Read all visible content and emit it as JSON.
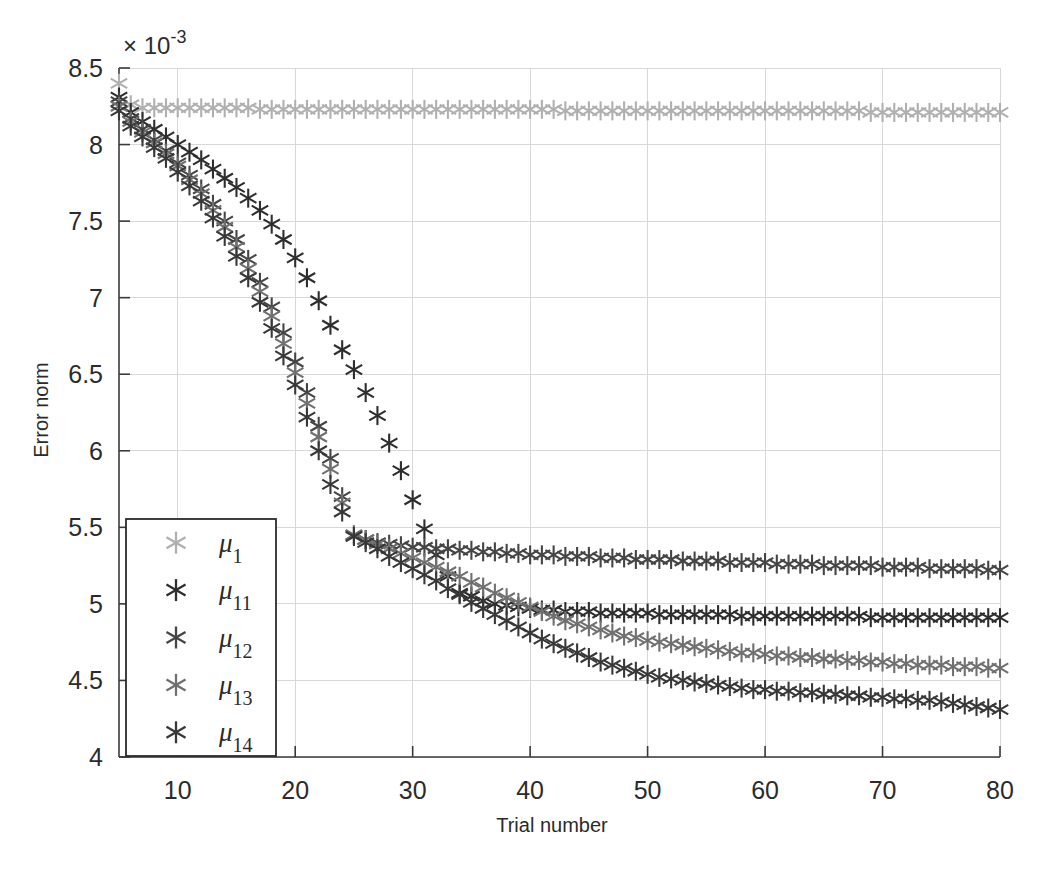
{
  "chart_data": {
    "type": "scatter",
    "title": "",
    "xlabel": "Trial number",
    "ylabel": "Error norm",
    "y_exponent_label": "× 10",
    "y_exponent_power": "-3",
    "xlim": [
      5,
      80
    ],
    "ylim": [
      4,
      8.5
    ],
    "xticks": [
      10,
      20,
      30,
      40,
      50,
      60,
      70,
      80
    ],
    "yticks": [
      4,
      4.5,
      5,
      5.5,
      6,
      6.5,
      7,
      7.5,
      8,
      8.5
    ],
    "grid": true,
    "legend_position": "lower left",
    "marker": "asterisk",
    "x": [
      5,
      6,
      7,
      8,
      9,
      10,
      11,
      12,
      13,
      14,
      15,
      16,
      17,
      18,
      19,
      20,
      21,
      22,
      23,
      24,
      25,
      26,
      27,
      28,
      29,
      30,
      31,
      32,
      33,
      34,
      35,
      36,
      37,
      38,
      39,
      40,
      41,
      42,
      43,
      44,
      45,
      46,
      47,
      48,
      49,
      50,
      51,
      52,
      53,
      54,
      55,
      56,
      57,
      58,
      59,
      60,
      61,
      62,
      63,
      64,
      65,
      66,
      67,
      68,
      69,
      70,
      71,
      72,
      73,
      74,
      75,
      76,
      77,
      78,
      79,
      80
    ],
    "series": [
      {
        "name": "μ",
        "subscript": "1",
        "color": "#b0b0b0",
        "values": [
          8.4,
          8.26,
          8.24,
          8.24,
          8.24,
          8.24,
          8.24,
          8.24,
          8.24,
          8.24,
          8.24,
          8.24,
          8.23,
          8.23,
          8.23,
          8.23,
          8.23,
          8.23,
          8.23,
          8.23,
          8.23,
          8.23,
          8.23,
          8.23,
          8.23,
          8.23,
          8.23,
          8.23,
          8.23,
          8.23,
          8.23,
          8.23,
          8.23,
          8.23,
          8.23,
          8.23,
          8.23,
          8.23,
          8.22,
          8.22,
          8.22,
          8.22,
          8.22,
          8.22,
          8.22,
          8.22,
          8.22,
          8.22,
          8.22,
          8.22,
          8.22,
          8.22,
          8.22,
          8.22,
          8.22,
          8.22,
          8.22,
          8.22,
          8.22,
          8.22,
          8.22,
          8.22,
          8.22,
          8.22,
          8.21,
          8.21,
          8.21,
          8.21,
          8.21,
          8.21,
          8.21,
          8.21,
          8.21,
          8.21,
          8.21,
          8.21
        ]
      },
      {
        "name": "μ",
        "subscript": "11",
        "color": "#2e2e2e",
        "values": [
          8.31,
          8.21,
          8.15,
          8.1,
          8.05,
          8.0,
          7.95,
          7.9,
          7.84,
          7.78,
          7.72,
          7.65,
          7.57,
          7.48,
          7.38,
          7.26,
          7.13,
          6.98,
          6.82,
          6.66,
          6.53,
          6.38,
          6.23,
          6.05,
          5.87,
          5.68,
          5.49,
          5.32,
          5.18,
          5.07,
          5.05,
          5.02,
          5.0,
          4.99,
          4.98,
          4.97,
          4.96,
          4.96,
          4.95,
          4.95,
          4.95,
          4.94,
          4.94,
          4.94,
          4.94,
          4.94,
          4.93,
          4.93,
          4.93,
          4.93,
          4.93,
          4.93,
          4.93,
          4.92,
          4.92,
          4.92,
          4.92,
          4.92,
          4.92,
          4.92,
          4.92,
          4.92,
          4.92,
          4.92,
          4.91,
          4.91,
          4.91,
          4.91,
          4.91,
          4.91,
          4.91,
          4.91,
          4.91,
          4.91,
          4.91,
          4.91
        ]
      },
      {
        "name": "μ",
        "subscript": "12",
        "color": "#454545",
        "values": [
          8.28,
          8.17,
          8.1,
          8.03,
          7.96,
          7.88,
          7.8,
          7.71,
          7.61,
          7.5,
          7.38,
          7.25,
          7.1,
          6.94,
          6.77,
          6.58,
          6.38,
          6.16,
          5.95,
          5.7,
          5.45,
          5.42,
          5.4,
          5.39,
          5.38,
          5.37,
          5.37,
          5.36,
          5.36,
          5.35,
          5.35,
          5.34,
          5.34,
          5.33,
          5.33,
          5.32,
          5.32,
          5.32,
          5.31,
          5.31,
          5.31,
          5.3,
          5.3,
          5.3,
          5.29,
          5.29,
          5.29,
          5.29,
          5.28,
          5.28,
          5.28,
          5.28,
          5.27,
          5.27,
          5.27,
          5.27,
          5.26,
          5.26,
          5.26,
          5.26,
          5.25,
          5.25,
          5.25,
          5.25,
          5.25,
          5.24,
          5.24,
          5.24,
          5.24,
          5.23,
          5.23,
          5.23,
          5.23,
          5.23,
          5.22,
          5.22
        ]
      },
      {
        "name": "μ",
        "subscript": "13",
        "color": "#707070",
        "values": [
          8.25,
          8.15,
          8.08,
          8.01,
          7.94,
          7.86,
          7.77,
          7.68,
          7.57,
          7.46,
          7.33,
          7.19,
          7.04,
          6.88,
          6.7,
          6.51,
          6.31,
          6.09,
          5.88,
          5.66,
          5.45,
          5.42,
          5.39,
          5.36,
          5.33,
          5.3,
          5.27,
          5.24,
          5.21,
          5.18,
          5.14,
          5.11,
          5.07,
          5.04,
          5.01,
          4.98,
          4.95,
          4.92,
          4.89,
          4.87,
          4.85,
          4.83,
          4.81,
          4.79,
          4.78,
          4.76,
          4.75,
          4.74,
          4.73,
          4.72,
          4.71,
          4.7,
          4.69,
          4.68,
          4.68,
          4.67,
          4.66,
          4.66,
          4.65,
          4.65,
          4.64,
          4.64,
          4.63,
          4.63,
          4.62,
          4.62,
          4.61,
          4.61,
          4.6,
          4.6,
          4.6,
          4.59,
          4.59,
          4.59,
          4.58,
          4.58
        ]
      },
      {
        "name": "μ",
        "subscript": "14",
        "color": "#383838",
        "values": [
          8.22,
          8.12,
          8.05,
          7.98,
          7.91,
          7.82,
          7.73,
          7.63,
          7.52,
          7.4,
          7.27,
          7.13,
          6.97,
          6.8,
          6.62,
          6.43,
          6.22,
          6.0,
          5.78,
          5.6,
          5.44,
          5.4,
          5.36,
          5.31,
          5.27,
          5.23,
          5.19,
          5.15,
          5.1,
          5.06,
          5.01,
          4.97,
          4.93,
          4.89,
          4.85,
          4.81,
          4.77,
          4.74,
          4.71,
          4.68,
          4.65,
          4.62,
          4.6,
          4.58,
          4.56,
          4.54,
          4.52,
          4.51,
          4.5,
          4.49,
          4.48,
          4.47,
          4.46,
          4.45,
          4.44,
          4.44,
          4.43,
          4.43,
          4.42,
          4.42,
          4.41,
          4.41,
          4.4,
          4.4,
          4.39,
          4.39,
          4.38,
          4.38,
          4.37,
          4.37,
          4.36,
          4.35,
          4.34,
          4.33,
          4.32,
          4.31
        ]
      }
    ]
  },
  "axes": {
    "y_label": "Error norm",
    "x_label": "Trial number",
    "exponent_prefix": "× 10",
    "exponent_power": "-3"
  }
}
